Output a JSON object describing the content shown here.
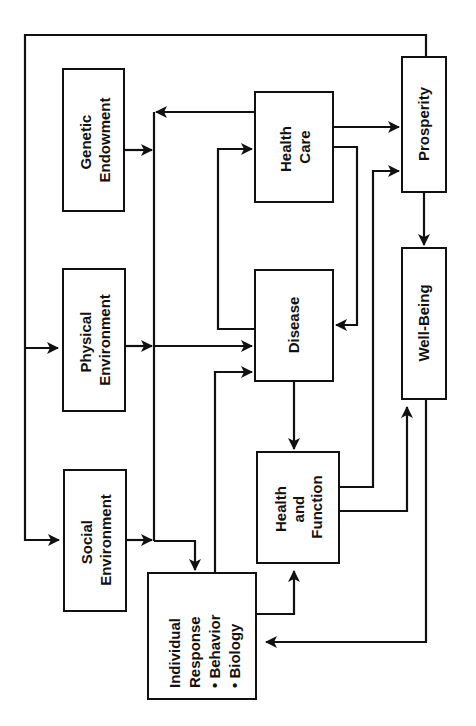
{
  "diagram": {
    "orientation": "rotated 90 degrees counter-clockwise",
    "nodes": {
      "genetic_endowment": {
        "line1": "Genetic",
        "line2": "Endowment"
      },
      "physical_environment": {
        "line1": "Physical",
        "line2": "Environment"
      },
      "social_environment": {
        "line1": "Social",
        "line2": "Environment"
      },
      "health_care": {
        "line1": "Health",
        "line2": "Care"
      },
      "disease": {
        "line1": "Disease"
      },
      "health_and_function": {
        "line1": "Health",
        "line2": "and",
        "line3": "Function"
      },
      "individual_response": {
        "line1": "Individual",
        "line2": "Response",
        "line3": "• Behavior",
        "line4": "• Biology"
      },
      "prosperity": {
        "line1": "Prosperity"
      },
      "well_being": {
        "line1": "Well-Being"
      }
    },
    "edges": [
      {
        "from": "Prosperity",
        "to": "Physical Environment"
      },
      {
        "from": "Prosperity",
        "to": "Social Environment"
      },
      {
        "from": "Genetic Endowment",
        "to": "Individual Response / Disease"
      },
      {
        "from": "Physical Environment",
        "to": "Disease"
      },
      {
        "from": "Social Environment",
        "to": "Individual Response"
      },
      {
        "from": "Health Care",
        "to": "Individual Response"
      },
      {
        "from": "Health Care",
        "to": "Prosperity"
      },
      {
        "from": "Health Care",
        "to": "Disease"
      },
      {
        "from": "Disease",
        "to": "Health Care"
      },
      {
        "from": "Disease",
        "to": "Health and Function"
      },
      {
        "from": "Individual Response",
        "to": "Disease"
      },
      {
        "from": "Individual Response",
        "to": "Health and Function"
      },
      {
        "from": "Health and Function",
        "to": "Prosperity"
      },
      {
        "from": "Health and Function",
        "to": "Well-Being"
      },
      {
        "from": "Prosperity",
        "to": "Well-Being"
      },
      {
        "from": "Well-Being",
        "to": "Individual Response"
      }
    ],
    "colors": {
      "stroke": "#111111",
      "background": "#ffffff"
    }
  }
}
